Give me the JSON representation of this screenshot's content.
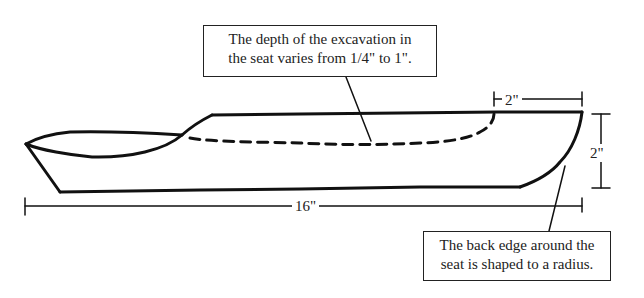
{
  "callouts": {
    "depth_note": {
      "line1": "The depth of the excavation in",
      "line2": "the seat varies from 1/4\" to 1\"."
    },
    "back_edge_note": {
      "line1": "The back edge around the",
      "line2": "seat is shaped to a radius."
    }
  },
  "dimensions": {
    "seat_back_width": "2\"",
    "height": "2\"",
    "overall_length": "16\""
  },
  "colors": {
    "line": "#111111",
    "background": "#ffffff"
  }
}
